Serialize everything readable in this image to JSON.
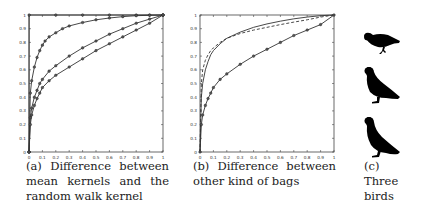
{
  "figure": {
    "panels": [
      {
        "id": "a",
        "caption_lines": [
          "(a)|Difference|between",
          "mean|kernels|and|the",
          "random walk kernel"
        ]
      },
      {
        "id": "b",
        "caption_lines": [
          "(b)|Difference|between",
          "other kind of bags"
        ]
      },
      {
        "id": "c",
        "caption_lines": [
          "(c)",
          "Three",
          "birds"
        ]
      }
    ]
  },
  "chart_data": [
    {
      "type": "line",
      "title": "",
      "caption": "(a) Difference between mean kernels and the random walk kernel",
      "xlabel": "",
      "ylabel": "",
      "xlim": [
        0,
        1
      ],
      "ylim": [
        0,
        1
      ],
      "grid": false,
      "legend": null,
      "xticks": [
        "0",
        "0.1",
        "0.2",
        "0.3",
        "0.4",
        "0.5",
        "0.6",
        "0.7",
        "0.8",
        "0.9",
        "1"
      ],
      "yticks": [
        "0",
        "0.1",
        "0.2",
        "0.3",
        "0.4",
        "0.5",
        "0.6",
        "0.7",
        "0.8",
        "0.9",
        "1"
      ],
      "series": [
        {
          "name": "curve-top",
          "style": "solid-markers",
          "x": [
            0,
            0.001,
            0.2,
            0.4,
            0.6,
            0.8,
            0.9,
            1
          ],
          "y": [
            0,
            1,
            1,
            1,
            1,
            1,
            1,
            1
          ]
        },
        {
          "name": "curve-fast",
          "style": "solid-markers",
          "x": [
            0,
            0.01,
            0.02,
            0.04,
            0.06,
            0.08,
            0.1,
            0.12,
            0.15,
            0.2,
            0.25,
            0.3,
            0.4,
            0.5,
            0.6,
            0.7,
            0.8,
            0.9,
            1
          ],
          "y": [
            0,
            0.43,
            0.52,
            0.62,
            0.69,
            0.74,
            0.78,
            0.81,
            0.84,
            0.87,
            0.9,
            0.92,
            0.945,
            0.965,
            0.978,
            0.988,
            0.995,
            0.998,
            1
          ]
        },
        {
          "name": "curve-mid",
          "style": "solid-markers",
          "x": [
            0,
            0.01,
            0.02,
            0.04,
            0.06,
            0.08,
            0.1,
            0.15,
            0.2,
            0.3,
            0.4,
            0.5,
            0.6,
            0.7,
            0.8,
            0.9,
            1
          ],
          "y": [
            0,
            0.25,
            0.32,
            0.4,
            0.45,
            0.5,
            0.53,
            0.59,
            0.63,
            0.7,
            0.76,
            0.81,
            0.86,
            0.9,
            0.94,
            0.97,
            1
          ]
        },
        {
          "name": "curve-low",
          "style": "solid-markers",
          "x": [
            0,
            0.01,
            0.02,
            0.04,
            0.06,
            0.08,
            0.1,
            0.15,
            0.2,
            0.3,
            0.4,
            0.5,
            0.6,
            0.7,
            0.8,
            0.9,
            1
          ],
          "y": [
            0,
            0.2,
            0.27,
            0.34,
            0.39,
            0.43,
            0.47,
            0.52,
            0.56,
            0.62,
            0.68,
            0.74,
            0.79,
            0.84,
            0.89,
            0.94,
            1
          ]
        }
      ]
    },
    {
      "type": "line",
      "title": "",
      "caption": "(b) Difference between other kind of bags",
      "xlabel": "",
      "ylabel": "",
      "xlim": [
        0,
        1
      ],
      "ylim": [
        0,
        1
      ],
      "grid": false,
      "legend": null,
      "xticks": [
        "0",
        "0.1",
        "0.2",
        "0.3",
        "0.4",
        "0.5",
        "0.6",
        "0.7",
        "0.8",
        "0.9",
        "1"
      ],
      "yticks": [
        "0",
        "0.1",
        "0.2",
        "0.3",
        "0.4",
        "0.5",
        "0.6",
        "0.7",
        "0.8",
        "0.9",
        "1"
      ],
      "series": [
        {
          "name": "curve-solid-upper",
          "style": "solid",
          "x": [
            0,
            0.01,
            0.02,
            0.04,
            0.06,
            0.08,
            0.1,
            0.15,
            0.2,
            0.3,
            0.4,
            0.5,
            0.6,
            0.7,
            0.8,
            0.9,
            1
          ],
          "y": [
            0,
            0.4,
            0.5,
            0.6,
            0.66,
            0.71,
            0.74,
            0.79,
            0.83,
            0.875,
            0.91,
            0.935,
            0.955,
            0.972,
            0.985,
            0.995,
            1
          ]
        },
        {
          "name": "curve-dashed",
          "style": "dashed",
          "x": [
            0,
            0.01,
            0.02,
            0.04,
            0.06,
            0.08,
            0.1,
            0.15,
            0.2,
            0.3,
            0.4,
            0.5,
            0.6,
            0.7,
            0.8,
            0.9,
            1
          ],
          "y": [
            0,
            0.5,
            0.6,
            0.67,
            0.71,
            0.74,
            0.76,
            0.8,
            0.83,
            0.865,
            0.89,
            0.91,
            0.93,
            0.948,
            0.965,
            0.985,
            1
          ]
        },
        {
          "name": "curve-solid-lower",
          "style": "solid-markers",
          "x": [
            0,
            0.01,
            0.02,
            0.04,
            0.06,
            0.08,
            0.1,
            0.15,
            0.2,
            0.3,
            0.4,
            0.5,
            0.6,
            0.7,
            0.8,
            0.9,
            1
          ],
          "y": [
            0,
            0.2,
            0.27,
            0.34,
            0.39,
            0.43,
            0.47,
            0.53,
            0.57,
            0.64,
            0.7,
            0.75,
            0.8,
            0.85,
            0.89,
            0.93,
            1
          ]
        }
      ]
    }
  ]
}
